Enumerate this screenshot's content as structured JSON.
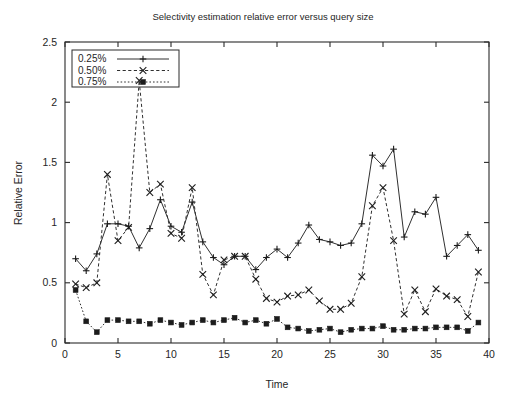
{
  "chart_data": {
    "type": "line",
    "title": "Selectivity estimation relative error versus query size",
    "xlabel": "Time",
    "ylabel": "Relative Error",
    "xlim": [
      0,
      40
    ],
    "ylim": [
      0,
      2.5
    ],
    "xticks": [
      0,
      5,
      10,
      15,
      20,
      25,
      30,
      35,
      40
    ],
    "xtick_labels": [
      "0",
      "5",
      "10",
      "15",
      "20",
      "25",
      "30",
      "35",
      "40"
    ],
    "yticks": [
      0,
      0.5,
      1,
      1.5,
      2,
      2.5
    ],
    "ytick_labels": [
      "0",
      "0.5",
      "1",
      "1.5",
      "2",
      "2.5"
    ],
    "grid": false,
    "legend_position": "upper-left",
    "x": [
      1,
      2,
      3,
      4,
      5,
      6,
      7,
      8,
      9,
      10,
      11,
      12,
      13,
      14,
      15,
      16,
      17,
      18,
      19,
      20,
      21,
      22,
      23,
      24,
      25,
      26,
      27,
      28,
      29,
      30,
      31,
      32,
      33,
      34,
      35,
      36,
      37,
      38,
      39
    ],
    "series": [
      {
        "name": "0.25%",
        "marker": "plus",
        "dash": "solid",
        "values": [
          0.7,
          0.6,
          0.74,
          0.99,
          0.99,
          0.97,
          0.79,
          0.95,
          1.19,
          0.97,
          0.92,
          1.17,
          0.84,
          0.71,
          0.65,
          0.72,
          0.72,
          0.61,
          0.71,
          0.78,
          0.71,
          0.83,
          0.98,
          0.86,
          0.84,
          0.81,
          0.83,
          0.99,
          1.56,
          1.47,
          1.61,
          0.88,
          1.09,
          1.07,
          1.21,
          0.72,
          0.81,
          0.9,
          0.77
        ]
      },
      {
        "name": "0.50%",
        "marker": "cross",
        "dash": "dashed",
        "values": [
          0.49,
          0.46,
          0.5,
          1.4,
          0.85,
          0.96,
          2.18,
          1.25,
          1.32,
          0.91,
          0.87,
          1.29,
          0.57,
          0.4,
          0.69,
          0.72,
          0.72,
          0.53,
          0.37,
          0.34,
          0.39,
          0.4,
          0.44,
          0.35,
          0.28,
          0.28,
          0.33,
          0.55,
          1.14,
          1.29,
          0.85,
          0.24,
          0.44,
          0.26,
          0.45,
          0.39,
          0.36,
          0.22,
          0.59
        ]
      },
      {
        "name": "0.75%",
        "marker": "square",
        "dash": "dotted",
        "values": [
          0.44,
          0.18,
          0.09,
          0.19,
          0.19,
          0.18,
          0.18,
          0.16,
          0.19,
          0.17,
          0.15,
          0.17,
          0.19,
          0.17,
          0.19,
          0.21,
          0.17,
          0.19,
          0.16,
          0.2,
          0.13,
          0.12,
          0.1,
          0.11,
          0.12,
          0.09,
          0.11,
          0.12,
          0.12,
          0.14,
          0.11,
          0.11,
          0.12,
          0.12,
          0.13,
          0.13,
          0.13,
          0.1,
          0.17
        ]
      }
    ]
  },
  "legend": {
    "entries": [
      {
        "label": "0.25%"
      },
      {
        "label": "0.50%"
      },
      {
        "label": "0.75%"
      }
    ]
  }
}
